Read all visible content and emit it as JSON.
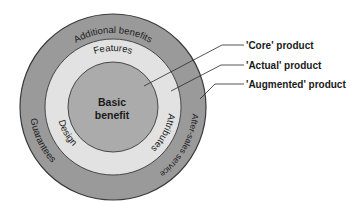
{
  "diagram": {
    "colors": {
      "outer_ring": "#9a9a9a",
      "middle_ring": "#e2e2e2",
      "inner_circle": "#ababab",
      "stroke": "#3a3a3a",
      "text": "#1a1a1a"
    },
    "core": {
      "line1": "Basic",
      "line2": "benefit"
    },
    "actual_ring": {
      "top": "Features",
      "left": "Design",
      "right": "Attributes"
    },
    "augmented_ring": {
      "top": "Additional benefits",
      "left": "Guarantees",
      "right": "After-sales service"
    },
    "callouts": [
      {
        "label": "'Core' product"
      },
      {
        "label": "'Actual' product"
      },
      {
        "label": "'Augmented' product"
      }
    ]
  }
}
